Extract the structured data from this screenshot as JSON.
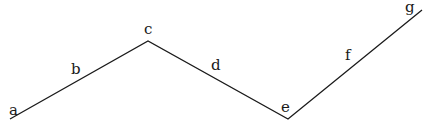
{
  "diagram": {
    "type": "zigzag-polyline",
    "stroke_color": "#1a1a1a",
    "vertices": [
      {
        "id": "a",
        "x": 10,
        "y": 119
      },
      {
        "id": "c",
        "x": 148,
        "y": 41
      },
      {
        "id": "e",
        "x": 288,
        "y": 119
      },
      {
        "id": "g",
        "x": 422,
        "y": 10
      }
    ],
    "labels": [
      {
        "text": "a",
        "x": 9,
        "y": 103
      },
      {
        "text": "b",
        "x": 71,
        "y": 62
      },
      {
        "text": "c",
        "x": 144,
        "y": 22
      },
      {
        "text": "d",
        "x": 211,
        "y": 58
      },
      {
        "text": "e",
        "x": 281,
        "y": 100
      },
      {
        "text": "f",
        "x": 345,
        "y": 48
      },
      {
        "text": "g",
        "x": 405,
        "y": 0
      }
    ]
  }
}
